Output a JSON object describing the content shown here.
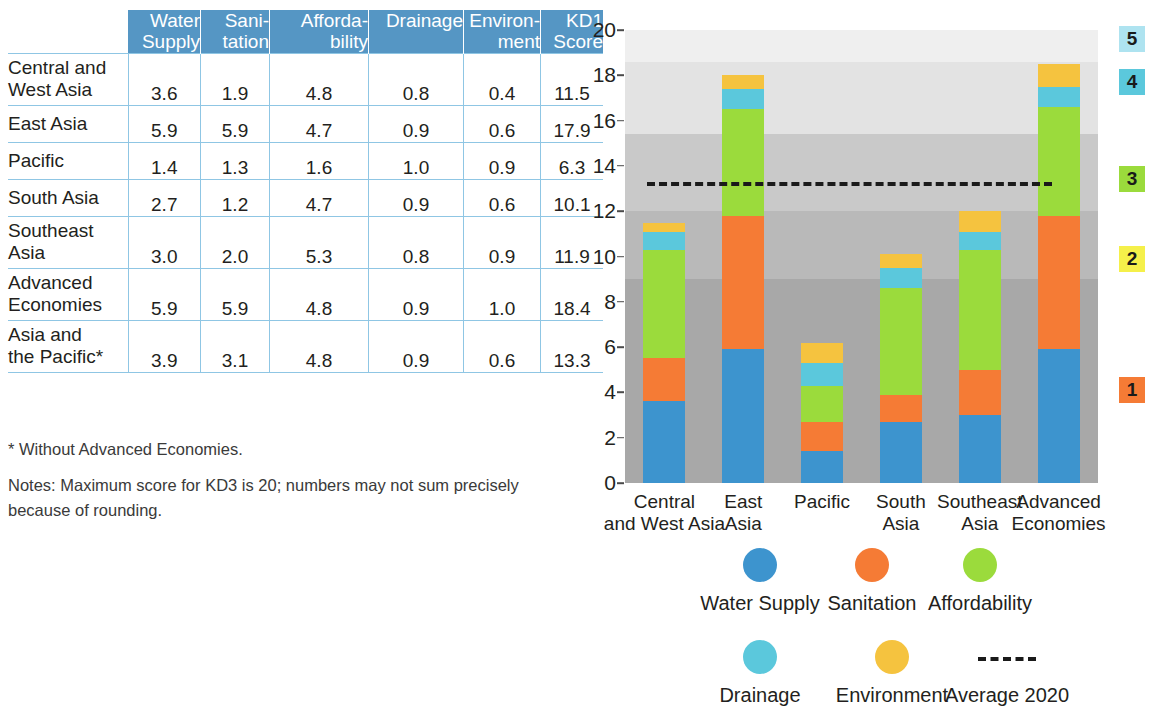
{
  "table": {
    "columns": [
      "Water\nSupply",
      "Sani-\ntation",
      "Afforda-\nbility",
      "Drainage",
      "Environ-\nment",
      "KD1\nScore"
    ],
    "rows": [
      {
        "label": "Central and\nWest Asia",
        "values": [
          "3.6",
          "1.9",
          "4.8",
          "0.8",
          "0.4",
          "11.5"
        ]
      },
      {
        "label": "East Asia",
        "values": [
          "5.9",
          "5.9",
          "4.7",
          "0.9",
          "0.6",
          "17.9"
        ]
      },
      {
        "label": "Pacific",
        "values": [
          "1.4",
          "1.3",
          "1.6",
          "1.0",
          "0.9",
          "6.3"
        ]
      },
      {
        "label": "South Asia",
        "values": [
          "2.7",
          "1.2",
          "4.7",
          "0.9",
          "0.6",
          "10.1"
        ]
      },
      {
        "label": "Southeast\nAsia",
        "values": [
          "3.0",
          "2.0",
          "5.3",
          "0.8",
          "0.9",
          "11.9"
        ]
      },
      {
        "label": "Advanced\nEconomies",
        "values": [
          "5.9",
          "5.9",
          "4.8",
          "0.9",
          "1.0",
          "18.4"
        ]
      },
      {
        "label": "Asia and\nthe Pacific*",
        "values": [
          "3.9",
          "3.1",
          "4.8",
          "0.9",
          "0.6",
          "13.3"
        ]
      }
    ],
    "footnote": "* Without Advanced Economies.",
    "notes": "Notes: Maximum score for KD3 is 20; numbers may not sum precisely because of rounding."
  },
  "chart_data": {
    "type": "bar",
    "stacked": true,
    "title": "",
    "xlabel": "",
    "ylabel": "",
    "ylim": [
      0,
      20
    ],
    "ytick_labels": [
      "0",
      "2",
      "4",
      "6",
      "8",
      "10",
      "12",
      "14",
      "16",
      "18",
      "20"
    ],
    "ytick_values": [
      0,
      2,
      4,
      6,
      8,
      10,
      12,
      14,
      16,
      18,
      20
    ],
    "grid": false,
    "legend_position": "bottom",
    "categories": [
      "Central\nand West Asia",
      "East\nAsia",
      "Pacific",
      "South\nAsia",
      "Southeast\nAsia",
      "Advanced\nEconomies"
    ],
    "series": [
      {
        "name": "Water Supply",
        "color": "#3d94ce",
        "values": [
          3.6,
          5.9,
          1.4,
          2.7,
          3.0,
          5.9
        ]
      },
      {
        "name": "Sanitation",
        "color": "#f57b35",
        "values": [
          1.9,
          5.9,
          1.3,
          1.2,
          2.0,
          5.9
        ]
      },
      {
        "name": "Affordability",
        "color": "#9bdb3c",
        "values": [
          4.8,
          4.7,
          1.6,
          4.7,
          5.3,
          4.8
        ]
      },
      {
        "name": "Drainage",
        "color": "#5bc8dc",
        "values": [
          0.8,
          0.9,
          1.0,
          0.9,
          0.8,
          0.9
        ]
      },
      {
        "name": "Environment",
        "color": "#f5c33f",
        "values": [
          0.4,
          0.6,
          0.9,
          0.6,
          0.9,
          1.0
        ]
      }
    ],
    "totals": [
      11.5,
      17.9,
      6.3,
      10.1,
      11.9,
      18.4
    ],
    "annotations": [
      {
        "name": "Average 2020",
        "type": "hline",
        "value": 13.3,
        "style": "dashed",
        "color": "#1a1a1a"
      }
    ],
    "background_bands": [
      {
        "from": 0,
        "to": 9,
        "color": "#a8a8a8",
        "label": "1"
      },
      {
        "from": 9,
        "to": 12,
        "color": "#b9b9b9",
        "label": "2"
      },
      {
        "from": 12,
        "to": 15.4,
        "color": "#c9c9c9",
        "label": "3"
      },
      {
        "from": 15.4,
        "to": 18.6,
        "color": "#e3e3e3",
        "label": "4"
      },
      {
        "from": 18.6,
        "to": 20,
        "color": "#efefef",
        "label": "5"
      }
    ],
    "scale_badges": [
      {
        "label": "5",
        "color": "#aee3f0",
        "value": 19.6
      },
      {
        "label": "4",
        "color": "#5bc8dc",
        "value": 17.7
      },
      {
        "label": "3",
        "color": "#9bdb3c",
        "value": 13.4
      },
      {
        "label": "2",
        "color": "#f5f04a",
        "value": 9.9
      },
      {
        "label": "1",
        "color": "#f57b35",
        "value": 4.1
      }
    ]
  },
  "legend": {
    "row1": [
      {
        "label": "Water Supply",
        "color": "#3d94ce",
        "icon": "circle-marker-icon"
      },
      {
        "label": "Sanitation",
        "color": "#f57b35",
        "icon": "circle-marker-icon"
      },
      {
        "label": "Affordability",
        "color": "#9bdb3c",
        "icon": "circle-marker-icon"
      }
    ],
    "row2": [
      {
        "label": "Drainage",
        "color": "#5bc8dc",
        "icon": "circle-marker-icon"
      },
      {
        "label": "Environment",
        "color": "#f5c33f",
        "icon": "circle-marker-icon"
      },
      {
        "label": "Average 2020",
        "color": "#1a1a1a",
        "icon": "dashed-line-icon"
      }
    ]
  }
}
